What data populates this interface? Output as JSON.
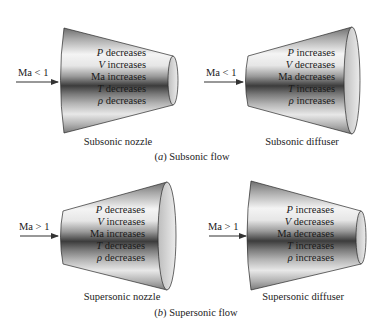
{
  "figure": {
    "sections": [
      {
        "id": "a",
        "letter": "a",
        "title": "Subsonic flow",
        "panels": [
          {
            "id": "subsonic-nozzle",
            "caption": "Subsonic nozzle",
            "inlet_label": "Ma < 1",
            "shape": "converging",
            "properties": [
              {
                "symbol": "P",
                "change": "decreases"
              },
              {
                "symbol": "V",
                "change": "increases"
              },
              {
                "symbol": "Ma",
                "change": "increases"
              },
              {
                "symbol": "T",
                "change": "decreases"
              },
              {
                "symbol": "ρ",
                "change": "decreases"
              }
            ]
          },
          {
            "id": "subsonic-diffuser",
            "caption": "Subsonic diffuser",
            "inlet_label": "Ma < 1",
            "shape": "diverging",
            "properties": [
              {
                "symbol": "P",
                "change": "increases"
              },
              {
                "symbol": "V",
                "change": "decreases"
              },
              {
                "symbol": "Ma",
                "change": "decreases"
              },
              {
                "symbol": "T",
                "change": "increases"
              },
              {
                "symbol": "ρ",
                "change": "increases"
              }
            ]
          }
        ]
      },
      {
        "id": "b",
        "letter": "b",
        "title": "Supersonic flow",
        "panels": [
          {
            "id": "supersonic-nozzle",
            "caption": "Supersonic nozzle",
            "inlet_label": "Ma > 1",
            "shape": "diverging",
            "properties": [
              {
                "symbol": "P",
                "change": "decreases"
              },
              {
                "symbol": "V",
                "change": "increases"
              },
              {
                "symbol": "Ma",
                "change": "increases"
              },
              {
                "symbol": "T",
                "change": "decreases"
              },
              {
                "symbol": "ρ",
                "change": "decreases"
              }
            ]
          },
          {
            "id": "supersonic-diffuser",
            "caption": "Supersonic diffuser",
            "inlet_label": "Ma > 1",
            "shape": "converging",
            "properties": [
              {
                "symbol": "P",
                "change": "increases"
              },
              {
                "symbol": "V",
                "change": "decreases"
              },
              {
                "symbol": "Ma",
                "change": "decreases"
              },
              {
                "symbol": "T",
                "change": "increases"
              },
              {
                "symbol": "ρ",
                "change": "increases"
              }
            ]
          }
        ]
      }
    ],
    "colors": {
      "metal_dark": "#3a3a3a",
      "metal_mid": "#8c8c8c",
      "metal_light": "#f2f2f2",
      "end_face": "#d9d9d9",
      "outline": "#2a2a2a",
      "text": "#1a1a1a"
    }
  }
}
